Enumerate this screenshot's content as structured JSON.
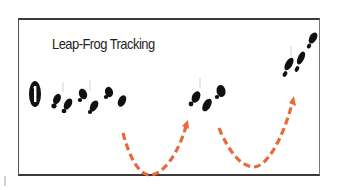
{
  "diagram": {
    "title": "Leap-Frog Tracking",
    "step_badge": "1",
    "colors": {
      "frame": "#3a3a3a",
      "footprints": "#111111",
      "arrows": "#e8693a",
      "background": "#ffffff"
    },
    "footprint_groups": [
      {
        "name": "start-group",
        "position": "left",
        "prints": 6
      },
      {
        "name": "middle-group",
        "position": "center",
        "prints": 3
      },
      {
        "name": "end-group",
        "position": "right",
        "prints": 4
      }
    ],
    "arrows": [
      {
        "name": "leap-arrow-1",
        "from": "start-group",
        "to": "middle-group",
        "style": "dashed-curve"
      },
      {
        "name": "leap-arrow-2",
        "from": "middle-group",
        "to": "end-group",
        "style": "dashed-curve"
      }
    ]
  }
}
